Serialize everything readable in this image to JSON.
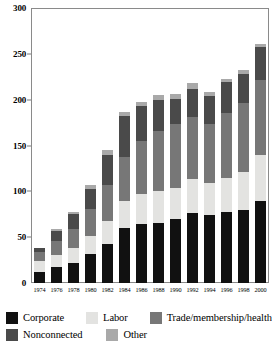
{
  "chart_data": {
    "type": "bar",
    "stacked": true,
    "title": "",
    "subtitle": "",
    "xlabel": "",
    "ylabel": "",
    "ylim": [
      0,
      300
    ],
    "ytick_step": 50,
    "yticks": [
      0,
      50,
      100,
      150,
      200,
      250,
      300
    ],
    "ytick_labels": [
      "0",
      "50",
      "100",
      "150",
      "200",
      "250",
      "300"
    ],
    "grid": false,
    "legend_position": "bottom",
    "categories": [
      "1974",
      "1976",
      "1978",
      "1980",
      "1982",
      "1984",
      "1986",
      "1988",
      "1990",
      "1992",
      "1994",
      "1996",
      "1998",
      "2000"
    ],
    "series": [
      {
        "name": "Corporate",
        "color": "#111111",
        "values": [
          12,
          17,
          22,
          32,
          43,
          60,
          64,
          66,
          70,
          76,
          74,
          78,
          80,
          90
        ]
      },
      {
        "name": "Labor",
        "color": "#e3e3e1",
        "values": [
          12,
          14,
          16,
          19,
          25,
          29,
          33,
          34,
          34,
          37,
          35,
          37,
          41,
          50
        ]
      },
      {
        "name": "Trade/membership/health",
        "color": "#777777",
        "values": [
          10,
          15,
          21,
          30,
          39,
          49,
          58,
          66,
          69,
          68,
          64,
          71,
          75,
          82
        ]
      },
      {
        "name": "Nonconnected",
        "color": "#4a4a4a",
        "values": [
          4,
          11,
          16,
          22,
          33,
          44,
          38,
          34,
          28,
          31,
          31,
          33,
          32,
          35
        ]
      },
      {
        "name": "Other",
        "color": "#a9a9a9",
        "values": [
          0,
          2,
          3,
          4,
          5,
          5,
          5,
          5,
          5,
          6,
          4,
          4,
          4,
          4
        ]
      }
    ],
    "totals": [
      38,
      59,
      78,
      107,
      145,
      187,
      198,
      205,
      206,
      218,
      208,
      223,
      232,
      261
    ]
  },
  "axes": {
    "y_tick_labels": [
      "300",
      "250",
      "200",
      "150",
      "100",
      "50",
      "0"
    ],
    "x_tick_labels": [
      "1974",
      "1976",
      "1978",
      "1980",
      "1982",
      "1984",
      "1986",
      "1988",
      "1990",
      "1992",
      "1994",
      "1996",
      "1998",
      "2000"
    ]
  },
  "legend": {
    "row1": [
      {
        "label": "Corporate",
        "color": "#111111",
        "swatch_name": "legend-swatch-corporate"
      },
      {
        "label": "Labor",
        "color": "#e3e3e1",
        "swatch_name": "legend-swatch-labor"
      },
      {
        "label": "Trade/membership/health",
        "color": "#777777",
        "swatch_name": "legend-swatch-trade-membership-health"
      }
    ],
    "row2": [
      {
        "label": "Nonconnected",
        "color": "#4a4a4a",
        "swatch_name": "legend-swatch-nonconnected"
      },
      {
        "label": "Other",
        "color": "#a9a9a9",
        "swatch_name": "legend-swatch-other"
      }
    ]
  },
  "colors": {
    "frame": "#8a8a8a",
    "background": "#ffffff",
    "text": "#000000"
  }
}
